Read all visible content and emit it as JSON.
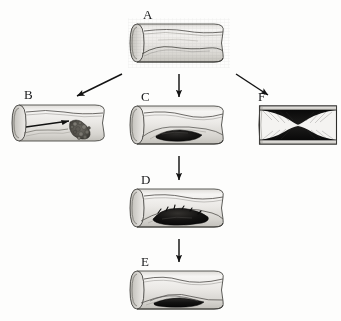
{
  "figure": {
    "background_color": "#fdfdfc",
    "ink_color": "#17181a",
    "style": "grayscale pen-and-ink medical illustration"
  },
  "panels": [
    {
      "id": "A",
      "label": "A",
      "name": "panel-a-normal-vessel",
      "shape": "cut-away-tube",
      "description": "Longitudinally opened blood vessel with smooth intimal surface and a mild fibrous streak along the wall",
      "x": 128,
      "y": 18,
      "width": 102,
      "height": 50,
      "label_x": 143,
      "label_y": 8,
      "lumen_fill": "#efeeec",
      "lesion_color": "none",
      "occlusion_percent": 0
    },
    {
      "id": "B",
      "label": "B",
      "name": "panel-b-embolization",
      "shape": "cut-away-tube",
      "description": "Vessel with flow arrow and granular mottled embolic debris shed downstream from an ulcerated plaque",
      "x": 10,
      "y": 98,
      "width": 100,
      "height": 50,
      "label_x": 24,
      "label_y": 88,
      "lumen_fill": "#efeeec",
      "lesion_color": "#58554f",
      "occlusion_percent": 25,
      "flow_arrow": true
    },
    {
      "id": "C",
      "label": "C",
      "name": "panel-c-small-plaque",
      "shape": "cut-away-tube",
      "description": "Vessel containing a small dark lipid-rich plaque raised beneath the intima",
      "x": 128,
      "y": 100,
      "width": 102,
      "height": 50,
      "label_x": 141,
      "label_y": 90,
      "lumen_fill": "#efeeec",
      "lesion_color": "#121212",
      "occlusion_percent": 35
    },
    {
      "id": "D",
      "label": "D",
      "name": "panel-d-enlarging-plaque",
      "shape": "cut-away-tube",
      "description": "Vessel with an enlarged ragged dark plaque and intraplaque hemorrhage narrowing the lumen",
      "x": 128,
      "y": 183,
      "width": 102,
      "height": 50,
      "label_x": 141,
      "label_y": 173,
      "lumen_fill": "#efeeec",
      "lesion_color": "#121212",
      "occlusion_percent": 55
    },
    {
      "id": "E",
      "label": "E",
      "name": "panel-e-mural-thrombus",
      "shape": "cut-away-tube",
      "description": "Vessel with a flattened elongated dark mural thrombus laid down over the plaque surface",
      "x": 128,
      "y": 265,
      "width": 102,
      "height": 50,
      "label_x": 141,
      "label_y": 255,
      "lumen_fill": "#efeeec",
      "lesion_color": "#121212",
      "occlusion_percent": 45
    },
    {
      "id": "F",
      "label": "F",
      "name": "panel-f-critical-stenosis",
      "shape": "rectangular-longitudinal-section",
      "description": "Longitudinal section showing dense black plaque from both walls constricting the lumen to a narrow slit",
      "x": 258,
      "y": 102,
      "width": 80,
      "height": 46,
      "label_x": 258,
      "label_y": 90,
      "lumen_fill": "#f4f3f1",
      "lesion_color": "#090909",
      "occlusion_percent": 85
    }
  ],
  "arrows": [
    {
      "name": "arrow-a-to-b",
      "from": "A",
      "to": "B",
      "direction": "diagonal-down-left",
      "x1": 122,
      "y1": 74,
      "x2": 77,
      "y2": 96
    },
    {
      "name": "arrow-a-to-c",
      "from": "A",
      "to": "C",
      "direction": "down",
      "x1": 179,
      "y1": 74,
      "x2": 179,
      "y2": 97
    },
    {
      "name": "arrow-a-to-f",
      "from": "A",
      "to": "F",
      "direction": "diagonal-down-right",
      "x1": 236,
      "y1": 74,
      "x2": 268,
      "y2": 95
    },
    {
      "name": "arrow-c-to-d",
      "from": "C",
      "to": "D",
      "direction": "down",
      "x1": 179,
      "y1": 156,
      "x2": 179,
      "y2": 180
    },
    {
      "name": "arrow-d-to-e",
      "from": "D",
      "to": "E",
      "direction": "down",
      "x1": 179,
      "y1": 239,
      "x2": 179,
      "y2": 262
    }
  ]
}
